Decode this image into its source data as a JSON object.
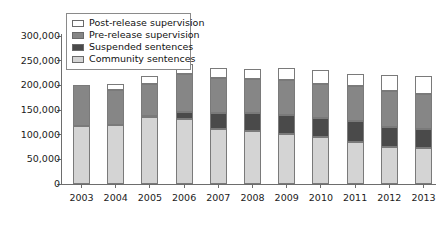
{
  "chart_data": {
    "type": "bar",
    "subtype": "stacked-vertical",
    "title": "",
    "subtitle": "",
    "xlabel": "",
    "ylabel": "",
    "categories": [
      "2003",
      "2004",
      "2005",
      "2006",
      "2007",
      "2008",
      "2009",
      "2010",
      "2011",
      "2012",
      "2013"
    ],
    "series": [
      {
        "name": "Community sentences",
        "color": "#d4d4d4",
        "values": [
          118000,
          119000,
          135000,
          131000,
          112000,
          108000,
          102000,
          96000,
          86000,
          76000,
          72000
        ]
      },
      {
        "name": "Suspended sentences",
        "color": "#4a4a4a",
        "values": [
          0,
          0,
          3000,
          14000,
          31000,
          35000,
          37000,
          38000,
          41000,
          40000,
          39000
        ]
      },
      {
        "name": "Pre-release supervision",
        "color": "#868686",
        "values": [
          82000,
          72000,
          65000,
          77000,
          72000,
          70000,
          72000,
          68000,
          71000,
          72000,
          71000
        ]
      },
      {
        "name": "Post-release supervision",
        "color": "#ffffff",
        "values": [
          0,
          12000,
          16000,
          22000,
          20000,
          20000,
          24000,
          30000,
          25000,
          33000,
          36000
        ]
      }
    ],
    "totals": [
      200000,
      203000,
      219000,
      244000,
      235000,
      233000,
      235000,
      232000,
      223000,
      221000,
      218000
    ],
    "ylim": [
      0,
      300000
    ],
    "yticks": [
      "0",
      "50,000",
      "100,000",
      "150,000",
      "200,000",
      "250,000",
      "300,000"
    ],
    "ytick_values": [
      0,
      50000,
      100000,
      150000,
      200000,
      250000,
      300000
    ],
    "grid": false,
    "legend_position": "top-left",
    "legend_entries": [
      "Post-release supervision",
      "Pre-release supervision",
      "Suspended sentences",
      "Community sentences"
    ],
    "legend_colors": [
      "#ffffff",
      "#868686",
      "#4a4a4a",
      "#d4d4d4"
    ]
  }
}
